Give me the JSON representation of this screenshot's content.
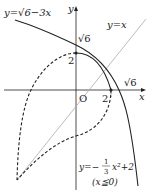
{
  "labels": {
    "curve_sqrt": "y=√6−3x",
    "line_yx": "y=x",
    "y_axis": "y",
    "x_axis": "x",
    "origin": "O",
    "sqrt6_y": "√6",
    "two_y": "2",
    "sqrt6_x": "√6",
    "two_x": "2",
    "parabola_eq": "y=−(1/3)x²+2",
    "parabola_lhs": "y=−",
    "parabola_frac_num": "1",
    "parabola_frac_den": "3",
    "parabola_rhs": "x²+2",
    "parabola_cond": "(x≦0)"
  },
  "colors": {
    "curve": "#222222",
    "line_yx": "#aaaaaa",
    "axis": "#222222"
  }
}
